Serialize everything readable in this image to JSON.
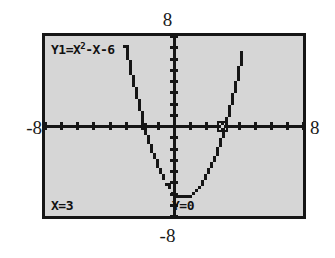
{
  "screen": {
    "device": "graphing-calculator",
    "equation_label": {
      "prefix": "Y1=X",
      "exponent": "2",
      "suffix": "-X-6",
      "full": "Y1=X2-X-6"
    },
    "trace_readout": {
      "x_label": "X=3",
      "y_label": "Y=0"
    },
    "window_labels": {
      "ymax": "8",
      "ymin": "-8",
      "xmin": "-8",
      "xmax": "8"
    },
    "colors": {
      "screen_background": "#d6d6d6",
      "ink": "#161616",
      "page_background": "#ffffff"
    }
  },
  "chart_data": {
    "type": "line",
    "title": "",
    "subtitle": "",
    "xlabel": "",
    "ylabel": "",
    "xlim": [
      -8,
      8
    ],
    "ylim": [
      -8,
      8
    ],
    "xtick_step": 1,
    "ytick_step": 1,
    "grid": false,
    "legend": "none",
    "annotations": [
      {
        "text": "Y1=X2-X-6",
        "position": "top-left"
      },
      {
        "text": "X=3",
        "position": "bottom-left"
      },
      {
        "text": "Y=0",
        "position": "bottom-center"
      },
      {
        "text": "8",
        "position": "above-screen-center"
      },
      {
        "text": "-8",
        "position": "below-screen-center"
      },
      {
        "text": "-8",
        "position": "left-of-screen"
      },
      {
        "text": "8",
        "position": "right-of-screen"
      }
    ],
    "cursor": {
      "x": 3,
      "y": 0,
      "marker": "open-circle"
    },
    "series": [
      {
        "name": "Y1 = x^2 - x - 6",
        "expression": "x^2 - x - 6",
        "roots": [
          -2,
          3
        ],
        "vertex": [
          0.5,
          -6.25
        ],
        "y_intercept": -6,
        "x": [
          -8,
          -7.5,
          -7,
          -6.5,
          -6,
          -5.5,
          -5,
          -4.5,
          -4,
          -3.5,
          -3,
          -2.5,
          -2,
          -1.5,
          -1,
          -0.5,
          0,
          0.5,
          1,
          1.5,
          2,
          2.5,
          3,
          3.5,
          4,
          4.5,
          5,
          5.5,
          6,
          6.5,
          7,
          7.5,
          8
        ],
        "y": [
          66,
          57.75,
          50,
          42.75,
          36,
          29.75,
          24,
          18.75,
          14,
          9.75,
          6,
          2.75,
          0,
          -2.25,
          -4,
          -5.25,
          -6,
          -6.25,
          -6,
          -5.25,
          -4,
          -2.25,
          0,
          2.75,
          6,
          9.75,
          14,
          18.75,
          24,
          29.75,
          36,
          42.75,
          50
        ]
      }
    ]
  }
}
